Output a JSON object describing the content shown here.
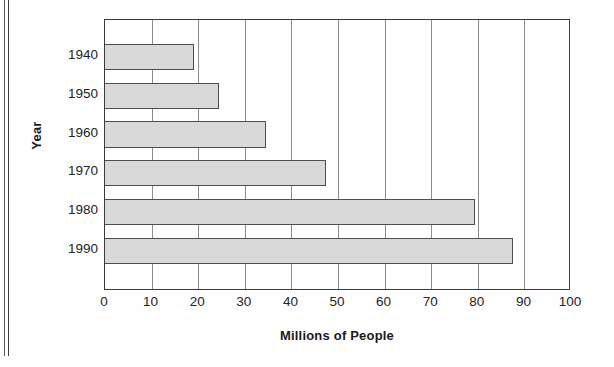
{
  "chart_data": {
    "type": "bar",
    "orientation": "horizontal",
    "title": "",
    "xlabel": "Millions of People",
    "ylabel": "Year",
    "categories": [
      "1940",
      "1950",
      "1960",
      "1970",
      "1980",
      "1990"
    ],
    "values": [
      19,
      24.5,
      34.5,
      47.5,
      79.5,
      87.5
    ],
    "xlim": [
      0,
      100
    ],
    "xticks": [
      0,
      10,
      20,
      30,
      40,
      50,
      60,
      70,
      80,
      90,
      100
    ],
    "xtick_labels": [
      "0",
      "10",
      "20",
      "30",
      "40",
      "50",
      "60",
      "70",
      "80",
      "90",
      "100"
    ],
    "grid": "vertical",
    "legend": "none",
    "bar_fill_color": "#d9d9d9",
    "bar_border_color": "#4d4d4d",
    "gridline_color": "#8c8c8c",
    "frame_color": "#3a3a3a",
    "background_color": "#ffffff"
  }
}
